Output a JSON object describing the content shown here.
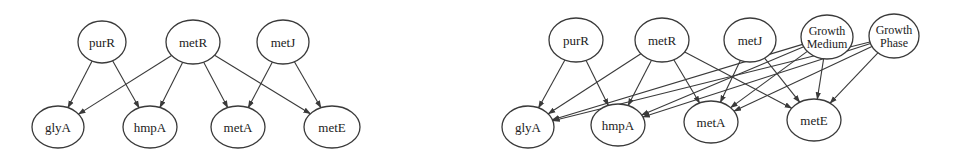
{
  "diagrams": [
    {
      "id": "left",
      "nodes": [
        {
          "id": "purR",
          "label": "purR",
          "cx": 102,
          "cy": 42,
          "rx": 24,
          "ry": 21
        },
        {
          "id": "metR",
          "label": "metR",
          "cx": 193,
          "cy": 42,
          "rx": 27,
          "ry": 22
        },
        {
          "id": "metJ",
          "label": "metJ",
          "cx": 283,
          "cy": 42,
          "rx": 26,
          "ry": 22
        },
        {
          "id": "glyA",
          "label": "glyA",
          "cx": 58,
          "cy": 127,
          "rx": 26,
          "ry": 21
        },
        {
          "id": "hmpA",
          "label": "hmpA",
          "cx": 150,
          "cy": 127,
          "rx": 27,
          "ry": 21
        },
        {
          "id": "metA",
          "label": "metA",
          "cx": 238,
          "cy": 127,
          "rx": 27,
          "ry": 21
        },
        {
          "id": "metE",
          "label": "metE",
          "cx": 332,
          "cy": 127,
          "rx": 28,
          "ry": 21
        }
      ],
      "edges": [
        [
          "purR",
          "glyA"
        ],
        [
          "purR",
          "hmpA"
        ],
        [
          "metR",
          "glyA"
        ],
        [
          "metR",
          "hmpA"
        ],
        [
          "metR",
          "metA"
        ],
        [
          "metR",
          "metE"
        ],
        [
          "metJ",
          "metA"
        ],
        [
          "metJ",
          "metE"
        ]
      ]
    },
    {
      "id": "right",
      "nodes": [
        {
          "id": "purR",
          "label": "purR",
          "cx": 576,
          "cy": 40,
          "rx": 27,
          "ry": 22
        },
        {
          "id": "metR",
          "label": "metR",
          "cx": 662,
          "cy": 40,
          "rx": 27,
          "ry": 22
        },
        {
          "id": "metJ",
          "label": "metJ",
          "cx": 750,
          "cy": 40,
          "rx": 26,
          "ry": 22
        },
        {
          "id": "GrowthMedium",
          "label": "Growth",
          "label2": "Medium",
          "cx": 827,
          "cy": 37,
          "rx": 26,
          "ry": 22
        },
        {
          "id": "GrowthPhase",
          "label": "Growth",
          "label2": "Phase",
          "cx": 894,
          "cy": 36,
          "rx": 25,
          "ry": 22
        },
        {
          "id": "glyA",
          "label": "glyA",
          "cx": 528,
          "cy": 127,
          "rx": 26,
          "ry": 21
        },
        {
          "id": "hmpA",
          "label": "hmpA",
          "cx": 618,
          "cy": 125,
          "rx": 27,
          "ry": 21
        },
        {
          "id": "metA",
          "label": "metA",
          "cx": 711,
          "cy": 122,
          "rx": 27,
          "ry": 21
        },
        {
          "id": "metE",
          "label": "metE",
          "cx": 814,
          "cy": 120,
          "rx": 27,
          "ry": 21
        }
      ],
      "edges": [
        [
          "purR",
          "glyA"
        ],
        [
          "purR",
          "hmpA"
        ],
        [
          "metR",
          "glyA"
        ],
        [
          "metR",
          "hmpA"
        ],
        [
          "metR",
          "metA"
        ],
        [
          "metR",
          "metE"
        ],
        [
          "metJ",
          "metA"
        ],
        [
          "metJ",
          "metE"
        ],
        [
          "GrowthMedium",
          "glyA"
        ],
        [
          "GrowthMedium",
          "hmpA"
        ],
        [
          "GrowthMedium",
          "metA"
        ],
        [
          "GrowthMedium",
          "metE"
        ],
        [
          "GrowthPhase",
          "glyA"
        ],
        [
          "GrowthPhase",
          "hmpA"
        ],
        [
          "GrowthPhase",
          "metA"
        ],
        [
          "GrowthPhase",
          "metE"
        ]
      ]
    }
  ]
}
